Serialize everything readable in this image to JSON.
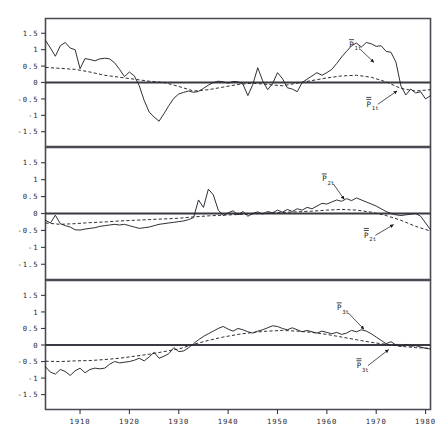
{
  "figure": {
    "title": "",
    "width": 444,
    "height": 438,
    "background": "#ffffff",
    "ink_color": "#24242c",
    "frame_color": "#4a4a52"
  },
  "chart_data": {
    "type": "line",
    "title": "",
    "xlabel": "",
    "ylabel": "",
    "xlim": [
      1903,
      1981
    ],
    "ylim": [
      -1.95,
      1.95
    ],
    "grid": false,
    "legend": "annotated-inline",
    "xticks": [
      1910,
      1920,
      1930,
      1940,
      1950,
      1960,
      1970,
      1980
    ],
    "xtick_labels": [
      "1910",
      "1920",
      "1930",
      "1940",
      "1950",
      "1960",
      "1970",
      "1980"
    ],
    "yticks": [
      1.5,
      1,
      0.5,
      0,
      -0.5,
      -1,
      -1.5
    ],
    "ytick_labels": [
      "1.5",
      "1",
      "0.5",
      "0",
      "-0.5",
      "-1",
      "-1.5"
    ],
    "panels": [
      {
        "index": 1,
        "name": "panel-1",
        "annotations": [
          {
            "id": "p1t-solid",
            "base": "P",
            "bar": "single",
            "sub": "1t",
            "label": "P̅1t",
            "x": 1965,
            "y": 1.08,
            "target_x": 1969.5,
            "target_y": 0.62
          },
          {
            "id": "p1t-dashed",
            "base": "P",
            "bar": "double",
            "sub": "1t",
            "label": "P̿1t",
            "x": 1968.5,
            "y": -0.74,
            "target_x": 1974.2,
            "target_y": -0.26
          }
        ],
        "series": [
          {
            "name": "P̅1t",
            "style": "solid",
            "description": "observed index series 1",
            "x": [
              1903,
              1904,
              1905,
              1906,
              1907,
              1908,
              1909,
              1910,
              1911,
              1912,
              1913,
              1914,
              1915,
              1916,
              1917,
              1918,
              1919,
              1920,
              1921,
              1922,
              1923,
              1924,
              1925,
              1926,
              1927,
              1928,
              1929,
              1930,
              1931,
              1932,
              1933,
              1934,
              1935,
              1936,
              1937,
              1938,
              1939,
              1940,
              1941,
              1942,
              1943,
              1944,
              1945,
              1946,
              1947,
              1948,
              1949,
              1950,
              1951,
              1952,
              1953,
              1954,
              1955,
              1956,
              1957,
              1958,
              1959,
              1960,
              1961,
              1962,
              1963,
              1964,
              1965,
              1966,
              1967,
              1968,
              1969,
              1970,
              1971,
              1972,
              1973,
              1974,
              1975,
              1976,
              1977,
              1978,
              1979,
              1980,
              1981
            ],
            "values": [
              1.28,
              1.05,
              0.8,
              1.12,
              1.22,
              1.05,
              1.0,
              0.42,
              0.73,
              0.7,
              0.66,
              0.72,
              0.74,
              0.72,
              0.6,
              0.4,
              0.18,
              0.32,
              0.2,
              -0.1,
              -0.55,
              -0.9,
              -1.05,
              -1.18,
              -0.95,
              -0.7,
              -0.48,
              -0.35,
              -0.3,
              -0.26,
              -0.3,
              -0.27,
              -0.18,
              -0.08,
              0.0,
              0.04,
              0.02,
              -0.02,
              0.03,
              0.02,
              -0.05,
              -0.4,
              -0.06,
              0.45,
              0.05,
              -0.22,
              -0.04,
              0.3,
              0.12,
              -0.16,
              -0.2,
              -0.28,
              0.0,
              0.1,
              0.2,
              0.3,
              0.22,
              0.3,
              0.4,
              0.58,
              0.78,
              0.95,
              1.12,
              1.2,
              1.08,
              1.22,
              1.18,
              1.1,
              1.12,
              0.95,
              0.92,
              0.62,
              -0.1,
              -0.38,
              -0.2,
              -0.32,
              -0.28,
              -0.5,
              -0.4
            ]
          },
          {
            "name": "P̿1t",
            "style": "dashed",
            "description": "smoothed / fitted trend series 1",
            "x": [
              1903,
              1906,
              1909,
              1912,
              1915,
              1918,
              1921,
              1924,
              1927,
              1930,
              1933,
              1936,
              1939,
              1942,
              1945,
              1948,
              1951,
              1954,
              1957,
              1960,
              1963,
              1966,
              1969,
              1972,
              1975,
              1978,
              1981
            ],
            "values": [
              0.46,
              0.43,
              0.4,
              0.32,
              0.22,
              0.16,
              0.1,
              0.04,
              0.0,
              -0.12,
              -0.26,
              -0.22,
              -0.14,
              -0.06,
              -0.02,
              -0.06,
              -0.1,
              -0.02,
              0.06,
              0.14,
              0.2,
              0.22,
              0.16,
              0.02,
              -0.18,
              -0.26,
              -0.22
            ]
          }
        ]
      },
      {
        "index": 2,
        "name": "panel-2",
        "annotations": [
          {
            "id": "p2t-solid",
            "base": "P",
            "bar": "single",
            "sub": "2t",
            "label": "P̅2t",
            "x": 1959.5,
            "y": 0.95,
            "target_x": 1963.5,
            "target_y": 0.42
          },
          {
            "id": "p2t-dashed",
            "base": "P",
            "bar": "double",
            "sub": "2t",
            "label": "P̿2t",
            "x": 1968,
            "y": -0.72,
            "target_x": 1973.5,
            "target_y": -0.33
          }
        ],
        "series": [
          {
            "name": "P̅2t",
            "style": "solid",
            "description": "observed index series 2",
            "x": [
              1903,
              1904,
              1905,
              1906,
              1907,
              1908,
              1909,
              1910,
              1911,
              1912,
              1913,
              1914,
              1915,
              1916,
              1917,
              1918,
              1919,
              1920,
              1921,
              1922,
              1923,
              1924,
              1925,
              1926,
              1927,
              1928,
              1929,
              1930,
              1931,
              1932,
              1933,
              1934,
              1935,
              1936,
              1937,
              1938,
              1939,
              1940,
              1941,
              1942,
              1943,
              1944,
              1945,
              1946,
              1947,
              1948,
              1949,
              1950,
              1951,
              1952,
              1953,
              1954,
              1955,
              1956,
              1957,
              1958,
              1959,
              1960,
              1961,
              1962,
              1963,
              1964,
              1965,
              1966,
              1967,
              1968,
              1969,
              1970,
              1971,
              1972,
              1973,
              1974,
              1975,
              1976,
              1977,
              1978,
              1979,
              1980,
              1981
            ],
            "values": [
              -0.2,
              -0.28,
              -0.05,
              -0.3,
              -0.36,
              -0.4,
              -0.48,
              -0.49,
              -0.46,
              -0.44,
              -0.42,
              -0.38,
              -0.36,
              -0.34,
              -0.32,
              -0.34,
              -0.32,
              -0.36,
              -0.4,
              -0.44,
              -0.42,
              -0.4,
              -0.36,
              -0.32,
              -0.3,
              -0.28,
              -0.26,
              -0.24,
              -0.22,
              -0.18,
              -0.12,
              0.4,
              0.18,
              0.72,
              0.55,
              0.1,
              -0.06,
              0.02,
              0.08,
              -0.04,
              0.06,
              -0.08,
              0.0,
              0.05,
              -0.02,
              0.06,
              0.02,
              0.1,
              0.04,
              0.12,
              0.06,
              0.14,
              0.1,
              0.18,
              0.14,
              0.22,
              0.3,
              0.28,
              0.34,
              0.4,
              0.36,
              0.44,
              0.38,
              0.46,
              0.4,
              0.34,
              0.28,
              0.22,
              0.14,
              0.06,
              0.0,
              -0.04,
              -0.06,
              -0.04,
              -0.02,
              0.0,
              -0.08,
              -0.28,
              -0.48
            ]
          },
          {
            "name": "P̿2t",
            "style": "dashed",
            "description": "smoothed / fitted trend series 2",
            "x": [
              1903,
              1906,
              1909,
              1912,
              1915,
              1918,
              1921,
              1924,
              1927,
              1930,
              1933,
              1936,
              1939,
              1942,
              1945,
              1948,
              1951,
              1954,
              1957,
              1960,
              1963,
              1966,
              1969,
              1972,
              1975,
              1978,
              1981
            ],
            "values": [
              -0.28,
              -0.32,
              -0.3,
              -0.27,
              -0.25,
              -0.22,
              -0.2,
              -0.18,
              -0.16,
              -0.14,
              -0.1,
              -0.07,
              -0.05,
              -0.03,
              -0.01,
              0.01,
              0.03,
              0.05,
              0.07,
              0.1,
              0.12,
              0.1,
              0.04,
              -0.06,
              -0.2,
              -0.38,
              -0.52
            ]
          }
        ]
      },
      {
        "index": 3,
        "name": "panel-3",
        "annotations": [
          {
            "id": "p3t-solid",
            "base": "P",
            "bar": "single",
            "sub": "3t",
            "label": "P̅3t",
            "x": 1962.5,
            "y": 1.05,
            "target_x": 1967.5,
            "target_y": 0.48
          },
          {
            "id": "p3t-dashed",
            "base": "P",
            "bar": "double",
            "sub": "3t",
            "label": "P̿3t",
            "x": 1966.5,
            "y": -0.7,
            "target_x": 1972.5,
            "target_y": -0.14
          }
        ],
        "series": [
          {
            "name": "P̅3t",
            "style": "solid",
            "description": "observed index series 3",
            "x": [
              1903,
              1904,
              1905,
              1906,
              1907,
              1908,
              1909,
              1910,
              1911,
              1912,
              1913,
              1914,
              1915,
              1916,
              1917,
              1918,
              1919,
              1920,
              1921,
              1922,
              1923,
              1924,
              1925,
              1926,
              1927,
              1928,
              1929,
              1930,
              1931,
              1932,
              1933,
              1934,
              1935,
              1936,
              1937,
              1938,
              1939,
              1940,
              1941,
              1942,
              1943,
              1944,
              1945,
              1946,
              1947,
              1948,
              1949,
              1950,
              1951,
              1952,
              1953,
              1954,
              1955,
              1956,
              1957,
              1958,
              1959,
              1960,
              1961,
              1962,
              1963,
              1964,
              1965,
              1966,
              1967,
              1968,
              1969,
              1970,
              1971,
              1972,
              1973,
              1974,
              1975,
              1976,
              1977,
              1978,
              1979,
              1980,
              1981
            ],
            "values": [
              -0.66,
              -0.82,
              -0.88,
              -0.74,
              -0.8,
              -0.92,
              -0.78,
              -0.7,
              -0.84,
              -0.74,
              -0.7,
              -0.72,
              -0.7,
              -0.58,
              -0.5,
              -0.54,
              -0.52,
              -0.5,
              -0.46,
              -0.4,
              -0.48,
              -0.36,
              -0.22,
              -0.4,
              -0.34,
              -0.26,
              -0.08,
              -0.2,
              -0.18,
              -0.08,
              0.04,
              0.16,
              0.26,
              0.34,
              0.42,
              0.5,
              0.56,
              0.48,
              0.42,
              0.5,
              0.46,
              0.4,
              0.36,
              0.42,
              0.46,
              0.52,
              0.58,
              0.56,
              0.5,
              0.46,
              0.52,
              0.46,
              0.4,
              0.44,
              0.4,
              0.36,
              0.42,
              0.38,
              0.34,
              0.38,
              0.32,
              0.36,
              0.44,
              0.4,
              0.46,
              0.42,
              0.34,
              0.24,
              0.14,
              0.04,
              0.1,
              0.0,
              -0.04,
              0.02,
              -0.04,
              -0.02,
              -0.06,
              -0.1,
              -0.12
            ]
          },
          {
            "name": "P̿3t",
            "style": "dashed",
            "description": "smoothed / fitted trend series 3",
            "x": [
              1903,
              1906,
              1909,
              1912,
              1915,
              1918,
              1921,
              1924,
              1927,
              1930,
              1933,
              1936,
              1939,
              1942,
              1945,
              1948,
              1951,
              1954,
              1957,
              1960,
              1963,
              1966,
              1969,
              1972,
              1975,
              1978,
              1981
            ],
            "values": [
              -0.49,
              -0.5,
              -0.48,
              -0.47,
              -0.44,
              -0.4,
              -0.34,
              -0.28,
              -0.2,
              -0.12,
              0.02,
              0.14,
              0.24,
              0.32,
              0.38,
              0.42,
              0.44,
              0.42,
              0.38,
              0.32,
              0.24,
              0.16,
              0.08,
              0.02,
              -0.04,
              -0.08,
              -0.1
            ]
          }
        ]
      }
    ]
  }
}
